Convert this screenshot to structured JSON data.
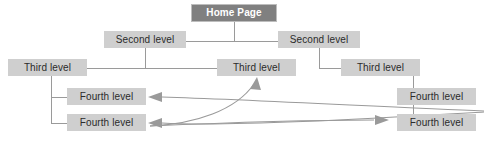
{
  "diagram": {
    "type": "sitemap-tree",
    "canvas": {
      "width": 484,
      "height": 142,
      "background": "#ffffff"
    },
    "colors": {
      "root_fill": "#808080",
      "root_text": "#ffffff",
      "node_fill": "#cfcfcf",
      "node_text": "#2b2b2b",
      "connector": "#9a9a9a",
      "arrow": "#9a9a9a",
      "root_border": "#bdbdbd"
    },
    "nodes": [
      {
        "id": "home",
        "label": "Home Page",
        "level": 1,
        "x": 191,
        "y": 4,
        "w": 86,
        "h": 18
      },
      {
        "id": "second-left",
        "label": "Second level",
        "level": 2,
        "x": 104,
        "y": 31,
        "w": 82,
        "h": 17
      },
      {
        "id": "second-right",
        "label": "Second level",
        "level": 2,
        "x": 278,
        "y": 31,
        "w": 82,
        "h": 17
      },
      {
        "id": "third-left",
        "label": "Third level",
        "level": 3,
        "x": 8,
        "y": 59,
        "w": 79,
        "h": 17
      },
      {
        "id": "third-middle",
        "label": "Third level",
        "level": 3,
        "x": 217,
        "y": 59,
        "w": 79,
        "h": 17
      },
      {
        "id": "third-right",
        "label": "Third level",
        "level": 3,
        "x": 341,
        "y": 59,
        "w": 79,
        "h": 17
      },
      {
        "id": "fourth-left-1",
        "label": "Fourth level",
        "level": 4,
        "x": 67,
        "y": 88,
        "w": 79,
        "h": 17
      },
      {
        "id": "fourth-left-2",
        "label": "Fourth level",
        "level": 4,
        "x": 67,
        "y": 114,
        "w": 79,
        "h": 17
      },
      {
        "id": "fourth-right-1",
        "label": "Fourth level",
        "level": 4,
        "x": 397,
        "y": 88,
        "w": 79,
        "h": 17
      },
      {
        "id": "fourth-right-2",
        "label": "Fourth level",
        "level": 4,
        "x": 397,
        "y": 114,
        "w": 79,
        "h": 17
      }
    ],
    "connectors": [
      {
        "from": "home",
        "to": "second-left",
        "style": "orthogonal"
      },
      {
        "from": "home",
        "to": "second-right",
        "style": "orthogonal"
      },
      {
        "from": "second-left",
        "to": "third-left",
        "style": "orthogonal"
      },
      {
        "from": "second-left",
        "to": "third-middle",
        "style": "orthogonal"
      },
      {
        "from": "second-right",
        "to": "third-right",
        "style": "orthogonal"
      },
      {
        "from": "third-left",
        "to": "fourth-left-1",
        "style": "orthogonal"
      },
      {
        "from": "third-left",
        "to": "fourth-left-2",
        "style": "orthogonal"
      },
      {
        "from": "third-right",
        "to": "fourth-right-1",
        "style": "orthogonal"
      },
      {
        "from": "third-right",
        "to": "fourth-right-2",
        "style": "orthogonal"
      }
    ],
    "cross_links": [
      {
        "id": "link-to-fourth-left-1",
        "from": "fourth-right-area",
        "to": "fourth-left-1",
        "style": "curved",
        "arrow": "left"
      },
      {
        "id": "link-to-fourth-left-2",
        "from": "fourth-right-area",
        "to": "fourth-left-2",
        "style": "curved",
        "arrow": "left"
      },
      {
        "id": "link-to-third-middle",
        "from": "fourth-left-area",
        "to": "third-middle",
        "style": "curved",
        "arrow": "up-right"
      },
      {
        "id": "link-to-fourth-right-2",
        "from": "fourth-left-area",
        "to": "fourth-right-2",
        "style": "curved",
        "arrow": "right"
      }
    ]
  }
}
